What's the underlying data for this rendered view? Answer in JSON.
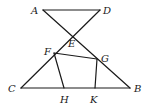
{
  "diagram": {
    "type": "geometry-figure",
    "points": {
      "A": {
        "x": 43,
        "y": 10,
        "label": "A",
        "lx": 31,
        "ly": 14
      },
      "D": {
        "x": 100,
        "y": 10,
        "label": "D",
        "lx": 103,
        "ly": 14
      },
      "E": {
        "x": 72,
        "y": 35,
        "label": "E",
        "lx": 68,
        "ly": 47
      },
      "F": {
        "x": 54,
        "y": 53,
        "label": "F",
        "lx": 44,
        "ly": 55
      },
      "G": {
        "x": 97,
        "y": 59,
        "label": "G",
        "lx": 101,
        "ly": 62
      },
      "C": {
        "x": 21,
        "y": 88,
        "label": "C",
        "lx": 8,
        "ly": 92
      },
      "B": {
        "x": 130,
        "y": 88,
        "label": "B",
        "lx": 134,
        "ly": 92
      },
      "H": {
        "x": 64,
        "y": 88,
        "label": "H",
        "lx": 60,
        "ly": 103
      },
      "K": {
        "x": 95,
        "y": 88,
        "label": "K",
        "lx": 90,
        "ly": 103
      }
    },
    "segments": [
      [
        "A",
        "D"
      ],
      [
        "A",
        "B"
      ],
      [
        "D",
        "C"
      ],
      [
        "C",
        "B"
      ],
      [
        "F",
        "G"
      ],
      [
        "F",
        "H"
      ],
      [
        "G",
        "K"
      ]
    ],
    "labels": [
      "A",
      "D",
      "E",
      "F",
      "G",
      "C",
      "B",
      "H",
      "K"
    ]
  }
}
